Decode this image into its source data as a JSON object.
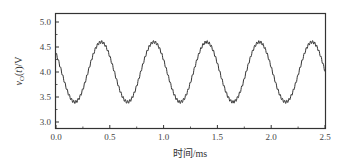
{
  "chart_data": {
    "type": "line",
    "title": "",
    "xlabel": "时间/ms",
    "ylabel": "v_O(t)/V",
    "ylabel_display": "vO(t)/V",
    "xlim": [
      0.0,
      2.5
    ],
    "ylim": [
      2.9,
      5.2
    ],
    "x_ticks": [
      0.0,
      0.5,
      1.0,
      1.5,
      2.0,
      2.5
    ],
    "x_tick_labels": [
      "0.0",
      "0.5",
      "1.0",
      "1.5",
      "2.0",
      "2.5"
    ],
    "y_ticks": [
      3.0,
      3.5,
      4.0,
      4.5,
      5.0
    ],
    "y_tick_labels": [
      "3.0",
      "3.5",
      "4.0",
      "4.5",
      "5.0"
    ],
    "grid": false,
    "legend": null,
    "series": [
      {
        "name": "vO(t)",
        "color": "#333333",
        "description": "Sinusoid with small high-frequency ripple",
        "offset_V": 4.0,
        "amplitude_V": 0.6,
        "period_ms": 0.49,
        "peak_times_ms": [
          0.42,
          0.91,
          1.39,
          1.88,
          2.37
        ],
        "trough_times_ms": [
          0.17,
          0.66,
          1.15,
          1.64,
          2.13
        ],
        "peak_value_V": 4.6,
        "trough_value_V": 3.4,
        "start_value_V": 4.3,
        "end_value_V": 3.9,
        "ripple_amplitude_V": 0.03,
        "x": [
          0.0,
          0.05,
          0.1,
          0.17,
          0.25,
          0.3,
          0.35,
          0.42,
          0.5,
          0.55,
          0.6,
          0.66,
          0.75,
          0.8,
          0.85,
          0.91,
          1.0,
          1.05,
          1.1,
          1.15,
          1.25,
          1.3,
          1.39,
          1.45,
          1.5,
          1.55,
          1.64,
          1.7,
          1.75,
          1.8,
          1.88,
          1.95,
          2.0,
          2.05,
          2.13,
          2.2,
          2.25,
          2.3,
          2.37,
          2.45,
          2.5
        ],
        "y": [
          4.3,
          3.95,
          3.6,
          3.4,
          3.65,
          4.05,
          4.4,
          4.6,
          4.4,
          4.1,
          3.7,
          3.4,
          3.7,
          4.05,
          4.4,
          4.6,
          4.35,
          3.95,
          3.6,
          3.4,
          3.8,
          4.2,
          4.6,
          4.45,
          4.1,
          3.7,
          3.4,
          3.6,
          3.95,
          4.35,
          4.6,
          4.4,
          4.05,
          3.7,
          3.4,
          3.65,
          4.0,
          4.35,
          4.6,
          4.3,
          3.9
        ]
      }
    ]
  }
}
